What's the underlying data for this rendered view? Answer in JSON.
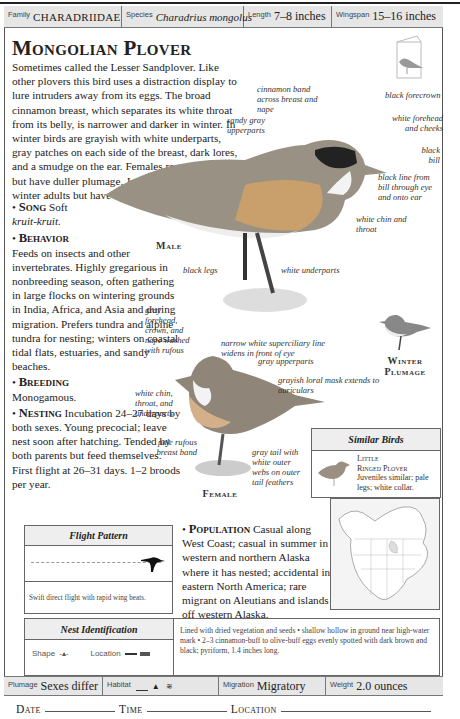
{
  "header": {
    "family_label": "Family",
    "family_value": "CHARADRIIDAE",
    "species_label": "Species",
    "species_value": "Charadrius mongolus",
    "length_label": "Length",
    "length_value": "7–8 inches",
    "wingspan_label": "Wingspan",
    "wingspan_value": "15–16 inches"
  },
  "title": "Mongolian Plover",
  "intro": "Sometimes called the Lesser Sandplover. Like other plovers this bird uses a distraction display to lure intruders away from its eggs. The broad cinnamon breast, which separates its white throat from its belly, is narrower and darker in winter. In winter birds are grayish with white underparts, gray patches on each side of the breast, dark lores, and a smudge on the ear. Females resemble males but have duller plumage. Juveniles are similar to winter adults but have a buff breast band.",
  "sections": {
    "song": {
      "heading": "Song",
      "text": "Soft",
      "call": "kruit-kruit."
    },
    "behavior": {
      "heading": "Behavior",
      "text": "Feeds on insects and other invertebrates. Highly gregarious in nonbreeding season, often gathering in large flocks on wintering grounds in India, Africa, and Asia and during migration. Prefers tundra and alpine tundra for nesting; winters on coastal tidal flats, estuaries, and sandy beaches."
    },
    "breeding": {
      "heading": "Breeding",
      "text": "Monogamous."
    },
    "nesting": {
      "heading": "Nesting",
      "text": "Incubation 24–27 days by both sexes. Young precocial; leave nest soon after hatching. Tended by both parents but feed themselves. First flight at 26–31 days. 1–2 broods per year."
    },
    "population": {
      "heading": "Population",
      "text": "Casual along West Coast; casual in summer in western and northern Alaska where it has nested; accidental in eastern North America; rare migrant on Aleutians and islands off western Alaska."
    }
  },
  "male_annotations": {
    "cinnamon_band": "cinnamon band across breast and nape",
    "sandy_gray": "sandy gray upperparts",
    "black_forecrown": "black forecrown",
    "white_forehead": "white forehead and cheeks",
    "black_bill": "black bill",
    "black_line": "black line from bill through eye and onto ear",
    "white_chin": "white chin and throat",
    "black_legs": "black legs",
    "white_underparts": "white underparts",
    "label": "Male"
  },
  "female_annotations": {
    "gray_forehead": "gray forehead, crown, and nape washed with rufous",
    "supercilliary": "narrow white superciliary line widens in front of eye",
    "gray_upperparts": "gray upperparts",
    "loral_mask": "grayish loral mask extends to auriculars",
    "white_chin": "white chin, throat, and underparts",
    "pale_rufous": "pale rufous breast band",
    "gray_tail": "gray tail with white outer webs on outer tail feathers",
    "label": "Female"
  },
  "winter_label": "Winter Plumage",
  "similar_birds": {
    "heading": "Similar Birds",
    "name_line1": "Little",
    "name_line2": "Ringed Plover",
    "desc": "Juveniles similar; pale legs; white collar."
  },
  "flight_pattern": {
    "heading": "Flight Pattern",
    "desc": "Swift direct flight with rapid wing beats."
  },
  "nest_identification": {
    "heading": "Nest Identification",
    "shape_label": "Shape",
    "location_label": "Location",
    "desc": "Lined with dried vegetation and seeds • shallow hollow in ground near high-water mark • 2–3 cinnamon-buff to olive-buff eggs evenly spotted with dark brown and black; pyriform, 1.4 inches long."
  },
  "footer": {
    "plumage_label": "Plumage",
    "plumage_value": "Sexes differ",
    "habitat_label": "Habitat",
    "migration_label": "Migration",
    "migration_value": "Migratory",
    "weight_label": "Weight",
    "weight_value": "2.0 ounces"
  },
  "log": {
    "date_label": "Date",
    "time_label": "Time",
    "location_label": "Location"
  }
}
